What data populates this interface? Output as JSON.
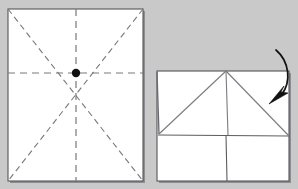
{
  "figure": {
    "background_color": "#c9c9c9",
    "paper_color": "#ffffff",
    "line_color": "#6e6e73",
    "edge_color": "#555558",
    "shadow_color": "#8e8e92",
    "marker_color": "#111111",
    "arrow_color": "#111111"
  },
  "panels": [
    {
      "id": "panel-left",
      "label": "Step 1: unfolded square with crease lines",
      "sheet": {
        "x": 8,
        "y": 9,
        "width": 135,
        "height": 172,
        "orientation": "portrait"
      },
      "creases": [
        {
          "name": "vertical-center-crease",
          "style": "dashed",
          "from": [
            76,
            9
          ],
          "to": [
            76,
            181
          ]
        },
        {
          "name": "horizontal-center-crease",
          "style": "dashed",
          "from": [
            8,
            73
          ],
          "to": [
            143,
            73
          ]
        },
        {
          "name": "diagonal-crease-tl-br",
          "style": "dashed",
          "from": [
            8,
            9
          ],
          "to": [
            143,
            181
          ]
        },
        {
          "name": "diagonal-crease-tr-bl",
          "style": "dashed",
          "from": [
            143,
            9
          ],
          "to": [
            8,
            181
          ]
        }
      ],
      "center_marker": {
        "name": "center-point",
        "x": 76,
        "y": 73,
        "radius": 4.2
      }
    },
    {
      "id": "panel-right",
      "label": "Step 2: partially folded form with fold arrow",
      "sheet": {
        "x": 157,
        "y": 71,
        "width": 132,
        "height": 110,
        "orientation": "landscape"
      },
      "folds": [
        {
          "name": "horizontal-fold-line",
          "style": "solid",
          "from": [
            158,
            135
          ],
          "to": [
            289,
            136
          ]
        },
        {
          "name": "vertical-fold-line-lower",
          "style": "solid",
          "from": [
            226,
            135
          ],
          "to": [
            227,
            181
          ]
        },
        {
          "name": "left-diagonal-fold",
          "style": "solid",
          "from": [
            226,
            71
          ],
          "to": [
            159,
            134
          ]
        },
        {
          "name": "right-diagonal-fold",
          "style": "solid",
          "from": [
            226,
            71
          ],
          "to": [
            289,
            136
          ]
        },
        {
          "name": "apex-vertical-fold",
          "style": "solid",
          "from": [
            226,
            71
          ],
          "to": [
            228,
            135
          ]
        },
        {
          "name": "left-short-edge",
          "style": "solid",
          "from": [
            157,
            72
          ],
          "to": [
            159,
            134
          ]
        }
      ],
      "apex": {
        "name": "triangle-apex",
        "x": 226,
        "y": 71
      },
      "arrow": {
        "name": "fold-direction-arrow",
        "type": "curved-arrow",
        "direction": "down-left",
        "path": "M 276,50 C 290,62 291,82 282,94",
        "tip": [
          271,
          104
        ],
        "head_angle_deg": 218
      }
    }
  ]
}
